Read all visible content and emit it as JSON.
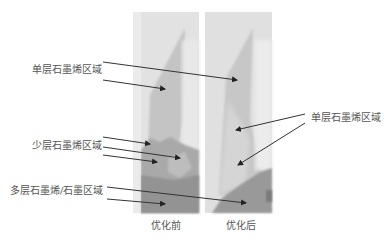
{
  "figure": {
    "panels": [
      {
        "id": "before",
        "caption": "优化前"
      },
      {
        "id": "after",
        "caption": "优化后"
      }
    ],
    "annotations": {
      "left_single_layer": "单层石墨烯区域",
      "left_few_layer": "少层石墨烯区域",
      "left_multi_layer": "多层石墨烯/石墨区域",
      "right_single_layer": "单层石墨烯区域"
    },
    "colors": {
      "background_panel": "#d9d9d9",
      "single_layer": "#bdbdbd",
      "few_layer": "#a6a6a6",
      "multi_layer": "#8f8f8f",
      "arrow": "#333333"
    }
  }
}
